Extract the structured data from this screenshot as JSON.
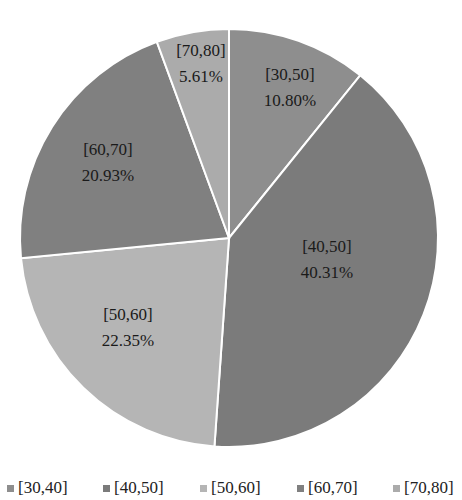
{
  "chart_data": {
    "type": "pie",
    "title": "",
    "start_angle": "12 o'clock, clockwise",
    "slices": [
      {
        "label": "[30,50]",
        "value": 10.8,
        "value_label": "10.80%",
        "color": "#8e8e8e"
      },
      {
        "label": "[40,50]",
        "value": 40.31,
        "value_label": "40.31%",
        "color": "#7b7b7b"
      },
      {
        "label": "[50,60]",
        "value": 22.35,
        "value_label": "22.35%",
        "color": "#b5b5b5"
      },
      {
        "label": "[60,70]",
        "value": 20.93,
        "value_label": "20.93%",
        "color": "#808080"
      },
      {
        "label": "[70,80]",
        "value": 5.61,
        "value_label": "5.61%",
        "color": "#ababab"
      }
    ],
    "legend": {
      "position": "bottom",
      "entries": [
        "[30,40]",
        "[40,50]",
        "[50,60]",
        "[60,70]",
        "[70,80]"
      ]
    }
  },
  "legend": {
    "items": [
      {
        "label": "[30,40]",
        "color": "#8e8e8e",
        "x": 7
      },
      {
        "label": "[40,50]",
        "color": "#7b7b7b",
        "x": 103
      },
      {
        "label": "[50,60]",
        "color": "#b5b5b5",
        "x": 200
      },
      {
        "label": "[60,70]",
        "color": "#808080",
        "x": 297
      },
      {
        "label": "[70,80]",
        "color": "#ababab",
        "x": 393
      }
    ]
  },
  "labels": {
    "s0_name": "[30,50]",
    "s0_pct": "10.80%",
    "s1_name": "[40,50]",
    "s1_pct": "40.31%",
    "s2_name": "[50,60]",
    "s2_pct": "22.35%",
    "s3_name": "[60,70]",
    "s3_pct": "20.93%",
    "s4_name": "[70,80]",
    "s4_pct": "5.61%"
  }
}
